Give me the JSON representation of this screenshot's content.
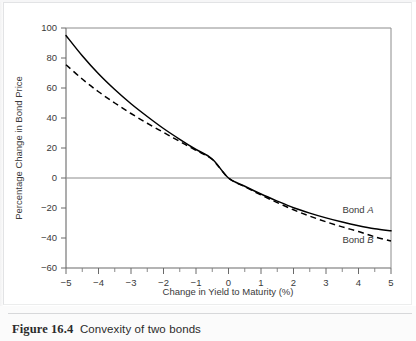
{
  "figure": {
    "number": "Figure 16.4",
    "title": "Convexity of two bonds"
  },
  "chart_data": {
    "type": "line",
    "title": "",
    "xlabel": "Change in Yield to Maturity (%)",
    "ylabel": "Percentage Change in Bond Price",
    "xlim": [
      -5,
      5
    ],
    "ylim": [
      -60,
      100
    ],
    "grid": false,
    "zero_line": true,
    "legend_position": "inline-right",
    "xticks": [
      -5,
      -4,
      -3,
      -2,
      -1,
      0,
      1,
      2,
      3,
      4,
      5
    ],
    "xtick_labels": [
      "−5",
      "−4",
      "−3",
      "−2",
      "−1",
      "0",
      "1",
      "2",
      "3",
      "4",
      "5"
    ],
    "xminor_step": 0.5,
    "yticks": [
      -60,
      -40,
      -20,
      0,
      20,
      40,
      60,
      80,
      100
    ],
    "ytick_labels": [
      "−60",
      "−40",
      "−20",
      "0",
      "20",
      "40",
      "60",
      "80",
      "100"
    ],
    "x": [
      -5,
      -4.5,
      -4,
      -3.5,
      -3,
      -2.5,
      -2,
      -1.5,
      -1,
      -0.5,
      0,
      0.5,
      1,
      1.5,
      2,
      2.5,
      3,
      3.5,
      4,
      4.5,
      5
    ],
    "series": [
      {
        "name": "Bond A",
        "label_text": "Bond ",
        "label_italic": "A",
        "style": "solid",
        "color": "#000000",
        "values": [
          95,
          81.5,
          69.5,
          59,
          49.5,
          41,
          33,
          25.8,
          19,
          12.7,
          0.0,
          -5.5,
          -10.7,
          -15.4,
          -19.8,
          -23.4,
          -26.6,
          -29.4,
          -31.8,
          -33.8,
          -35.2
        ],
        "values_note": "y at x=0 is 0; interior points follow convex decay"
      },
      {
        "name": "Bond B",
        "label_text": "Bond ",
        "label_italic": "B",
        "style": "dashed",
        "color": "#000000",
        "values": [
          75.5,
          66,
          57.5,
          50,
          43,
          36.5,
          30.4,
          24.4,
          18.4,
          12.3,
          0.0,
          -5.8,
          -11.3,
          -16.4,
          -21.2,
          -25.4,
          -29.2,
          -32.6,
          -35.7,
          -39.2,
          -42
        ],
        "values_note": "dashed curve, lower convexity at left, falls further at right"
      }
    ],
    "series_a_anchor": [
      -5,
      95
    ],
    "series_b_anchor": [
      -5,
      75.5
    ],
    "series_a_end": [
      5,
      -35.2
    ],
    "series_b_end": [
      5,
      -42
    ]
  },
  "legend": {
    "bond_a": "Bond A",
    "bond_b": "Bond B"
  }
}
